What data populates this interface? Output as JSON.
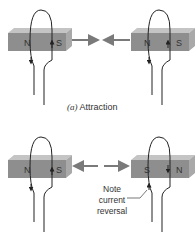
{
  "figure": {
    "panel_a": {
      "caption_letter": "(a)",
      "caption_text": "Attraction",
      "left_magnet": {
        "left_pole": "N",
        "right_pole": "S"
      },
      "right_magnet": {
        "left_pole": "N",
        "right_pole": "S"
      },
      "force_arrows": "toward each other"
    },
    "panel_b": {
      "left_magnet": {
        "left_pole": "N",
        "right_pole": "S"
      },
      "right_magnet": {
        "left_pole": "S",
        "right_pole": "N"
      },
      "force_arrows": "away from each other",
      "note_lines": [
        "Note",
        "current",
        "reversal"
      ]
    },
    "colors": {
      "magnet_front": "#8e8e8e",
      "magnet_top": "#c4c4c4",
      "magnet_side": "#a9a9a9",
      "force_arrow": "#7a7a7a",
      "wire": "#222222"
    }
  }
}
